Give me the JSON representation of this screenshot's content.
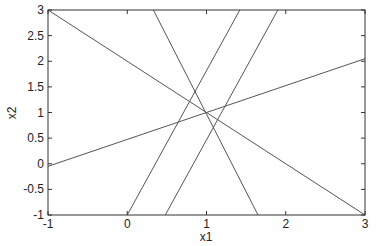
{
  "chart_data": {
    "type": "line",
    "title": "",
    "xlabel": "x1",
    "ylabel": "x2",
    "xlim": [
      -1,
      3
    ],
    "ylim": [
      -1,
      3
    ],
    "grid": false,
    "legend": null,
    "xticks": [
      -1,
      0,
      1,
      2,
      3
    ],
    "xtick_labels": [
      "-1",
      "0",
      "1",
      "2",
      "3"
    ],
    "yticks": [
      -1,
      -0.5,
      0,
      0.5,
      1,
      1.5,
      2,
      2.5,
      3
    ],
    "ytick_labels": [
      "-1",
      "-0.5",
      "0",
      "0.5",
      "1",
      "1.5",
      "2",
      "2.5",
      "3"
    ],
    "intersection_point": [
      0.95,
      1.0
    ],
    "series": [
      {
        "name": "line-1",
        "x": [
          -1,
          3
        ],
        "y": [
          3,
          -1
        ]
      },
      {
        "name": "line-2",
        "x": [
          -1,
          3
        ],
        "y": [
          -0.05,
          2.05
        ]
      },
      {
        "name": "line-3",
        "x": [
          0.33,
          1.65
        ],
        "y": [
          3,
          -1
        ]
      },
      {
        "name": "line-4",
        "x": [
          0.0,
          1.42
        ],
        "y": [
          -1,
          3
        ]
      },
      {
        "name": "line-5",
        "x": [
          0.48,
          1.9
        ],
        "y": [
          -1,
          3
        ]
      }
    ],
    "line_color": "#555555",
    "axis_color": "#333333"
  }
}
